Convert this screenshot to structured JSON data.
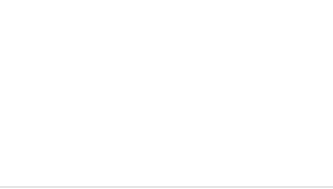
{
  "chart_data": {
    "type": "line",
    "title": "",
    "xlabel": "",
    "ylabel": "Mean Flock Size",
    "categories": [
      "North",
      "Centre",
      "South"
    ],
    "series": [
      {
        "name": "Mean Flock Size",
        "values": [
          420,
          210,
          150
        ]
      }
    ],
    "yticks": [
      450,
      400,
      350,
      300,
      250,
      200,
      150
    ],
    "ylim": [
      150,
      450
    ],
    "grid": true,
    "legend": false,
    "marker": "square",
    "smooth": true
  },
  "colors": {
    "background": "#ffffff",
    "grid": "#d8d8d8",
    "line": "#555555",
    "marker": "#0b0b0b",
    "text": "#1c1c1c"
  }
}
